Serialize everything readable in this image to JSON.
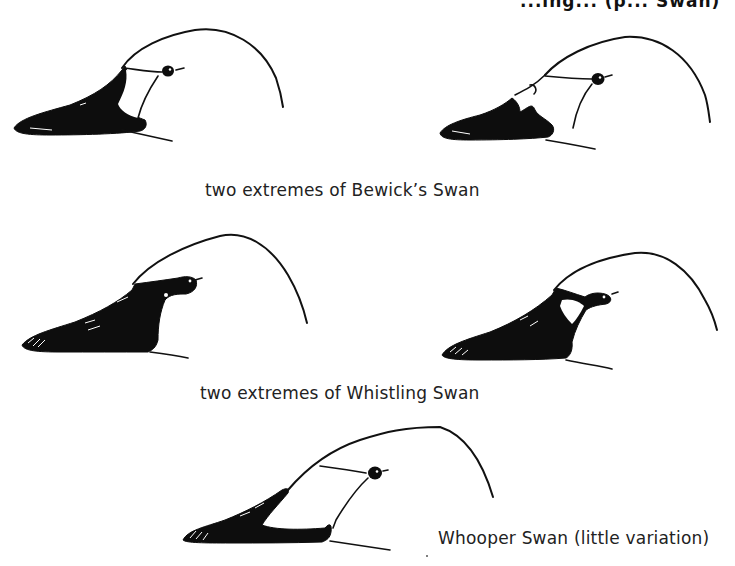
{
  "figure": {
    "header_fragment": "...ing... (p... Swan)",
    "captions": {
      "bewicks": "two extremes of Bewick’s Swan",
      "whistling": "two extremes of Whistling Swan",
      "whooper": "Whooper Swan (little variation)"
    },
    "panels": [
      {
        "id": "bewicks-swan-extreme-1",
        "species": "Bewick’s Swan",
        "bill_pattern": "extensive black, yellow patch small"
      },
      {
        "id": "bewicks-swan-extreme-2",
        "species": "Bewick’s Swan",
        "bill_pattern": "yellow extends forward, jagged edge"
      },
      {
        "id": "whistling-swan-extreme-1",
        "species": "Whistling Swan",
        "bill_pattern": "all black with small yellow spot"
      },
      {
        "id": "whistling-swan-extreme-2",
        "species": "Whistling Swan",
        "bill_pattern": "black with small yellow patch before eye"
      },
      {
        "id": "whooper-swan",
        "species": "Whooper Swan",
        "bill_pattern": "yellow wedge extends beyond nostril"
      }
    ],
    "colors": {
      "ink": "#0d0d0d",
      "paper": "#ffffff"
    }
  }
}
